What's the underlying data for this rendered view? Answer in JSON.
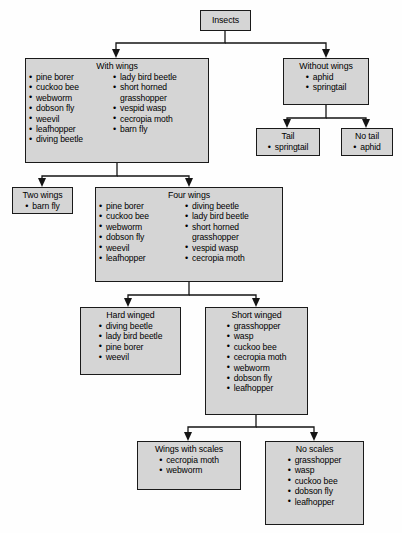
{
  "diagram": {
    "type": "dichotomous-classification-key",
    "subject": "Insects",
    "nodes": {
      "insects": {
        "title": "Insects",
        "items": []
      },
      "with_wings": {
        "title": "With wings",
        "col1": [
          "pine borer",
          "cuckoo bee",
          "webworm",
          "dobson fly",
          "weevil",
          "leafhopper",
          "diving beetle"
        ],
        "col2": [
          "lady bird beetle",
          "short horned",
          "grasshopper",
          "vespid wasp",
          "cecropia moth",
          "barn fly"
        ],
        "col2_continuation_index": 2
      },
      "without_wings": {
        "title": "Without wings",
        "items": [
          "aphid",
          "springtail"
        ]
      },
      "tail": {
        "title": "Tail",
        "items": [
          "springtail"
        ]
      },
      "no_tail": {
        "title": "No tail",
        "items": [
          "aphid"
        ]
      },
      "two_wings": {
        "title": "Two wings",
        "items": [
          "barn fly"
        ]
      },
      "four_wings": {
        "title": "Four wings",
        "col1": [
          "pine borer",
          "cuckoo bee",
          "webworm",
          "dobson fly",
          "weevil",
          "leafhopper"
        ],
        "col2": [
          "diving beetle",
          "lady bird beetle",
          "short horned",
          "grasshopper",
          "vespid wasp",
          "cecropia moth"
        ],
        "col2_continuation_index": 3
      },
      "hard_winged": {
        "title": "Hard winged",
        "items": [
          "diving beetle",
          "lady bird beetle",
          "pine borer",
          "weevil"
        ]
      },
      "short_winged": {
        "title": "Short winged",
        "items": [
          "grasshopper",
          "wasp",
          "cuckoo bee",
          "cecropia moth",
          "webworm",
          "dobson fly",
          "leafhopper"
        ]
      },
      "wings_with_scales": {
        "title": "Wings with scales",
        "items": [
          "cecropia moth",
          "webworm"
        ]
      },
      "no_scales": {
        "title": "No scales",
        "items": [
          "grasshopper",
          "wasp",
          "cuckoo bee",
          "dobson fly",
          "leafhopper"
        ]
      }
    },
    "colors": {
      "node_fill": "#d5d5d5",
      "node_border": "#1a1a1a",
      "connector": "#151515",
      "text": "#000000",
      "background": "#fefefe"
    }
  }
}
